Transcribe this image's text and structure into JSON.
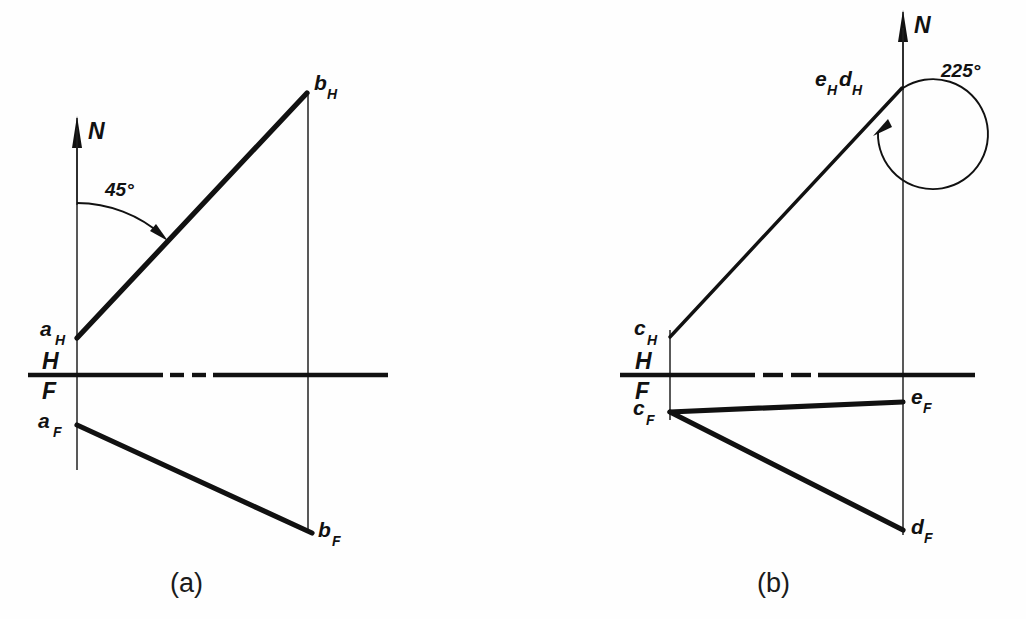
{
  "figure": {
    "background_color": "#fefefe",
    "ink_color": "#111111"
  },
  "panels": [
    {
      "id": "a",
      "caption": "(a)",
      "north_label": "N",
      "angle_label": "45°",
      "angle_value": 45,
      "angle_units": "degrees",
      "points": [
        {
          "key": "aH",
          "base": "a",
          "sub": "H",
          "label": "aH",
          "x": 77,
          "y": 338,
          "view": "horizontal"
        },
        {
          "key": "bH",
          "base": "b",
          "sub": "H",
          "label": "bH",
          "x": 307,
          "y": 93,
          "view": "horizontal"
        },
        {
          "key": "aF",
          "base": "a",
          "sub": "F",
          "label": "aF",
          "x": 77,
          "y": 425,
          "view": "frontal"
        },
        {
          "key": "bF",
          "base": "b",
          "sub": "F",
          "label": "bF",
          "x": 312,
          "y": 533,
          "view": "frontal"
        }
      ],
      "reference_line": {
        "upper_label": "H",
        "lower_label": "F",
        "y": 375,
        "x_start": 28,
        "x_end": 388
      },
      "lines": [
        {
          "name": "aH-bH",
          "from": "aH",
          "to": "bH",
          "weight": "heavy"
        },
        {
          "name": "aF-bF",
          "from": "aF",
          "to": "bF",
          "weight": "heavy"
        }
      ],
      "projectors": [
        {
          "name": "projector-a",
          "x": 77,
          "y_top": 128,
          "y_bottom": 470
        },
        {
          "name": "projector-b",
          "x": 308,
          "y_top": 95,
          "y_bottom": 533
        }
      ]
    },
    {
      "id": "b",
      "caption": "(b)",
      "north_label": "N",
      "angle_label": "225°",
      "angle_value": 225,
      "angle_units": "degrees",
      "points": [
        {
          "key": "eHdH",
          "base": "eH dH",
          "sub": "",
          "label": "eHdH",
          "x": 902,
          "y": 88,
          "view": "horizontal"
        },
        {
          "key": "cH",
          "base": "c",
          "sub": "H",
          "label": "cH",
          "x": 670,
          "y": 337,
          "view": "horizontal"
        },
        {
          "key": "cF",
          "base": "c",
          "sub": "F",
          "label": "cF",
          "x": 670,
          "y": 412,
          "view": "frontal"
        },
        {
          "key": "eF",
          "base": "e",
          "sub": "F",
          "label": "eF",
          "x": 903,
          "y": 402,
          "view": "frontal"
        },
        {
          "key": "dF",
          "base": "d",
          "sub": "F",
          "label": "dF",
          "x": 903,
          "y": 530,
          "view": "frontal"
        }
      ],
      "reference_line": {
        "upper_label": "H",
        "lower_label": "F",
        "y": 375,
        "x_start": 620,
        "x_end": 975
      },
      "lines": [
        {
          "name": "cH-eHdH",
          "from": "cH",
          "to": "eHdH",
          "weight": "medium"
        },
        {
          "name": "cF-eF",
          "from": "cF",
          "to": "eF",
          "weight": "heavy"
        },
        {
          "name": "cF-dF",
          "from": "cF",
          "to": "dF",
          "weight": "heavy"
        }
      ],
      "projectors": [
        {
          "name": "projector-c",
          "x": 670,
          "y_top": 330,
          "y_bottom": 420
        },
        {
          "name": "projector-ed",
          "x": 903,
          "y_top": 10,
          "y_bottom": 535
        }
      ]
    }
  ]
}
